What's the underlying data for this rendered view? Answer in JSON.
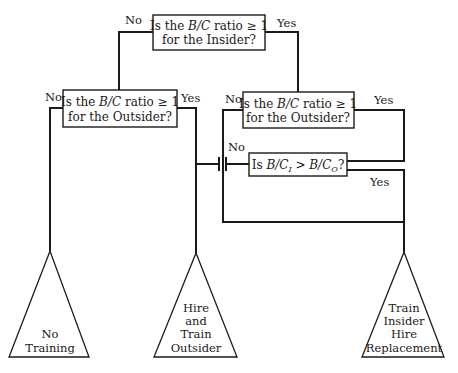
{
  "decisions": [
    {
      "id": "insider",
      "line1_pre": "Is the ",
      "line1_var": "B/C",
      "line1_post": " ratio ≥ 1",
      "line2": "for the Insider?",
      "no_label": "No",
      "yes_label": "Yes"
    },
    {
      "id": "outsider_left",
      "line1_pre": "Is the ",
      "line1_var": "B/C",
      "line1_post": " ratio ≥ 1",
      "line2": "for the Outsider?",
      "no_label": "No",
      "yes_label": "Yes"
    },
    {
      "id": "outsider_right",
      "line1_pre": "Is the ",
      "line1_var": "B/C",
      "line1_post": " ratio ≥ 1",
      "line2": "for the Outsider?",
      "no_label": "No",
      "yes_label": "Yes"
    },
    {
      "id": "compare",
      "pre": "Is ",
      "lhs_var": "B/C",
      "lhs_sub": "I",
      "op": " > ",
      "rhs_var": "B/C",
      "rhs_sub": "O",
      "post": "?",
      "no_label": "No",
      "yes_label": "Yes"
    }
  ],
  "outcomes": [
    {
      "id": "no_training",
      "lines": [
        "No",
        "Training"
      ]
    },
    {
      "id": "hire_train_outsider",
      "lines": [
        "Hire",
        "and",
        "Train",
        "Outsider"
      ]
    },
    {
      "id": "train_insider_hire_replacement",
      "lines": [
        "Train",
        "Insider",
        "Hire",
        "Replacement"
      ]
    }
  ]
}
